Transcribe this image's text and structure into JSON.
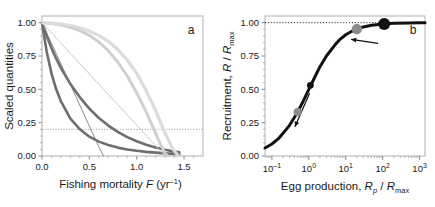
{
  "figure": {
    "panel_a_label": "a",
    "panel_b_label": "b"
  },
  "chart_data": [
    {
      "type": "line",
      "panel": "a",
      "title": "",
      "xlabel": "Fishing mortality F (yr⁻¹)",
      "ylabel": "Scaled quantities",
      "xlim": [
        0.0,
        1.7
      ],
      "ylim": [
        0.0,
        1.05
      ],
      "xticks": [
        0.0,
        0.5,
        1.0,
        1.5
      ],
      "xticklabels": [
        "0.0",
        "0.5",
        "1.0",
        "1.5"
      ],
      "yticks": [
        0.0,
        0.25,
        0.5,
        0.75,
        1.0
      ],
      "yticklabels": [
        "0.00",
        "0.25",
        "0.50",
        "0.75",
        "1.00"
      ],
      "grid": false,
      "legend": "none",
      "reference_lines": [
        {
          "orientation": "horizontal",
          "value": 0.2,
          "style": "dotted",
          "color": "#8a8a8a"
        }
      ],
      "series": [
        {
          "name": "dark-gray-thick-steep",
          "color": "#6e6e6e",
          "width": 2.6,
          "x": [
            0.0,
            0.05,
            0.1,
            0.15,
            0.2,
            0.3,
            0.4,
            0.5,
            0.6,
            0.7,
            0.8,
            0.9,
            1.0,
            1.1,
            1.2,
            1.3,
            1.4,
            1.45
          ],
          "y": [
            1.0,
            0.78,
            0.62,
            0.5,
            0.41,
            0.28,
            0.2,
            0.145,
            0.108,
            0.082,
            0.063,
            0.049,
            0.039,
            0.031,
            0.025,
            0.02,
            0.016,
            0.014
          ]
        },
        {
          "name": "dark-gray-thick-shallow",
          "color": "#6e6e6e",
          "width": 2.6,
          "x": [
            0.0,
            0.05,
            0.1,
            0.15,
            0.2,
            0.3,
            0.4,
            0.5,
            0.6,
            0.7,
            0.8,
            0.9,
            1.0,
            1.1,
            1.2,
            1.3,
            1.4,
            1.45
          ],
          "y": [
            1.0,
            0.9,
            0.81,
            0.73,
            0.66,
            0.54,
            0.44,
            0.355,
            0.285,
            0.228,
            0.181,
            0.142,
            0.111,
            0.085,
            0.064,
            0.047,
            0.033,
            0.027
          ]
        },
        {
          "name": "dark-gray-thin-linear",
          "color": "#7a7a7a",
          "width": 0.9,
          "x": [
            0.0,
            0.1,
            0.2,
            0.3,
            0.4,
            0.5,
            0.6,
            0.65
          ],
          "y": [
            1.0,
            0.845,
            0.69,
            0.535,
            0.38,
            0.225,
            0.07,
            0.0
          ]
        },
        {
          "name": "light-gray-thin-linear",
          "color": "#c9c9c9",
          "width": 1.0,
          "x": [
            0.0,
            0.2,
            0.4,
            0.6,
            0.8,
            1.0,
            1.2,
            1.3
          ],
          "y": [
            1.0,
            0.846,
            0.692,
            0.538,
            0.385,
            0.231,
            0.077,
            0.0
          ]
        },
        {
          "name": "light-gray-thick-sigmoid-inner",
          "color": "#d0d0d0",
          "width": 3.0,
          "x": [
            0.0,
            0.1,
            0.2,
            0.3,
            0.4,
            0.5,
            0.6,
            0.7,
            0.8,
            0.9,
            1.0,
            1.1,
            1.2,
            1.25,
            1.3,
            1.33
          ],
          "y": [
            1.0,
            0.993,
            0.982,
            0.965,
            0.94,
            0.905,
            0.855,
            0.79,
            0.705,
            0.6,
            0.475,
            0.33,
            0.17,
            0.09,
            0.02,
            0.0
          ]
        },
        {
          "name": "light-gray-thick-sigmoid-outer",
          "color": "#dcdcdc",
          "width": 3.2,
          "x": [
            0.0,
            0.1,
            0.2,
            0.3,
            0.4,
            0.5,
            0.6,
            0.7,
            0.8,
            0.9,
            1.0,
            1.1,
            1.2,
            1.3,
            1.38,
            1.44
          ],
          "y": [
            1.0,
            0.996,
            0.99,
            0.979,
            0.962,
            0.938,
            0.905,
            0.86,
            0.8,
            0.72,
            0.62,
            0.49,
            0.34,
            0.17,
            0.055,
            0.0
          ]
        }
      ]
    },
    {
      "type": "line",
      "panel": "b",
      "title": "",
      "xlabel": "Egg production, Rₚ / Rₘₐₓ",
      "ylabel": "Recruitment, R / Rₘₐₓ",
      "xscale": "log",
      "xlim": [
        0.065,
        1400
      ],
      "ylim": [
        0.0,
        1.05
      ],
      "xticks": [
        0.1,
        1,
        10,
        100,
        1000
      ],
      "xticklabels": [
        "10⁻¹",
        "10⁰",
        "10¹",
        "10²",
        "10³"
      ],
      "yticks": [
        0.0,
        0.25,
        0.5,
        0.75,
        1.0
      ],
      "yticklabels": [
        "0.00",
        "0.25",
        "0.50",
        "0.75",
        "1.00"
      ],
      "grid": false,
      "legend": "none",
      "reference_lines": [
        {
          "orientation": "horizontal",
          "value": 1.0,
          "style": "dotted",
          "color": "#111111"
        }
      ],
      "series": [
        {
          "name": "beverton-holt-recruitment",
          "color": "#111111",
          "width": 3.0,
          "x": [
            0.065,
            0.1,
            0.15,
            0.2,
            0.3,
            0.5,
            0.7,
            1.0,
            1.5,
            2.0,
            3.0,
            5.0,
            7.0,
            10.0,
            15.0,
            20.0,
            30.0,
            50.0,
            100.0,
            200.0,
            500.0,
            1000.0,
            1400.0
          ],
          "y": [
            0.06,
            0.09,
            0.13,
            0.17,
            0.23,
            0.33,
            0.41,
            0.5,
            0.6,
            0.67,
            0.75,
            0.83,
            0.875,
            0.909,
            0.937,
            0.952,
            0.968,
            0.98,
            0.99,
            0.995,
            0.998,
            0.999,
            0.999
          ]
        }
      ],
      "markers": [
        {
          "name": "marker-low-gray",
          "x": 0.5,
          "y": 0.33,
          "color": "#8c8c8c",
          "radius": 4.2
        },
        {
          "name": "marker-low-black",
          "x": 1.1,
          "y": 0.53,
          "color": "#111111",
          "radius": 3.4
        },
        {
          "name": "marker-high-gray",
          "x": 20.0,
          "y": 0.952,
          "color": "#8c8c8c",
          "radius": 5.2
        },
        {
          "name": "marker-high-black",
          "x": 110.0,
          "y": 0.99,
          "color": "#111111",
          "radius": 6.0
        }
      ],
      "annotations": [
        {
          "name": "arrow-down-left",
          "from_x": 1.05,
          "from_y": 0.47,
          "to_x": 0.42,
          "to_y": 0.22,
          "label": ""
        },
        {
          "name": "arrow-left",
          "from_x": 75.0,
          "from_y": 0.845,
          "to_x": 14.0,
          "to_y": 0.875,
          "label": ""
        }
      ]
    }
  ]
}
